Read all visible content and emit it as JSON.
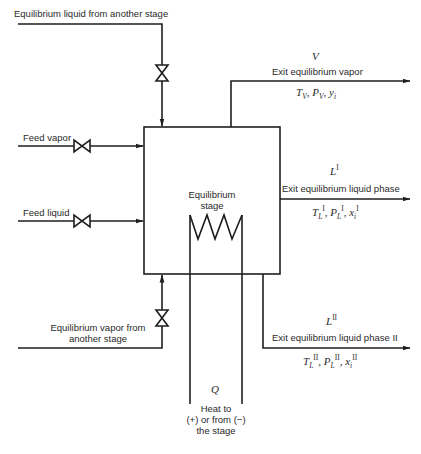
{
  "diagram": {
    "type": "process-flow",
    "title": "Equilibrium stage",
    "stage_box": {
      "label_line1": "Equilibrium",
      "label_line2": "stage"
    },
    "inlets": {
      "liquid_from_stage": {
        "label": "Equilibrium liquid from another stage",
        "has_valve": true
      },
      "feed_vapor": {
        "label": "Feed vapor",
        "has_valve": true
      },
      "feed_liquid": {
        "label": "Feed liquid",
        "has_valve": true
      },
      "vapor_from_stage": {
        "label_line1": "Equilibrium vapor from",
        "label_line2": "another stage",
        "has_valve": true
      }
    },
    "outlets": {
      "vapor": {
        "symbol": "V",
        "label": "Exit equilibrium vapor",
        "props": {
          "T": "T",
          "T_sub": "V",
          "P": "P",
          "P_sub": "V",
          "comp": "y",
          "comp_sub": "i"
        }
      },
      "liquid_I": {
        "symbol": "L",
        "symbol_sup": "I",
        "label": "Exit equilibrium liquid phase",
        "props": {
          "T": "T",
          "T_sub": "L",
          "sup": "I",
          "P": "P",
          "P_sub": "L",
          "comp": "x",
          "comp_sub": "i"
        }
      },
      "liquid_II": {
        "symbol": "L",
        "symbol_sup": "II",
        "label": "Exit equilibrium liquid phase II",
        "props": {
          "T": "T",
          "T_sub": "L",
          "sup": "II",
          "P": "P",
          "P_sub": "L",
          "comp": "x",
          "comp_sub": "i"
        }
      }
    },
    "heat": {
      "symbol": "Q",
      "label_line1": "Heat to",
      "label_line2": "(+) or from (−)",
      "label_line3": "the stage"
    },
    "colors": {
      "line": "#1e1e1e",
      "text": "#2a2a2a",
      "background": "#ffffff"
    }
  }
}
